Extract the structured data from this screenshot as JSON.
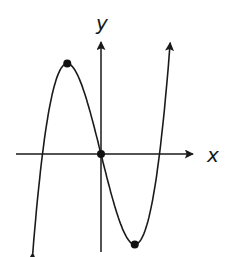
{
  "chart_data": {
    "type": "line",
    "title": "",
    "xlabel": "x",
    "ylabel": "y",
    "grid": false,
    "function": "cubic with three real roots, local maximum left of y-axis, local minimum right of y-axis, passing through origin",
    "roots": [
      -3,
      0,
      3
    ],
    "marked_points": [
      {
        "name": "local-maximum",
        "x": -1.73,
        "y": 10.39
      },
      {
        "name": "origin",
        "x": 0,
        "y": 0
      },
      {
        "name": "local-minimum",
        "x": 1.73,
        "y": -10.39
      }
    ],
    "end_behavior": {
      "left": "down",
      "right": "up"
    },
    "xlim": [
      -4.5,
      4.8
    ],
    "ylim": [
      -11,
      12
    ]
  },
  "axes": {
    "x_label": "x",
    "y_label": "y"
  },
  "colors": {
    "stroke": "#1a1a1a",
    "background": "#ffffff"
  }
}
